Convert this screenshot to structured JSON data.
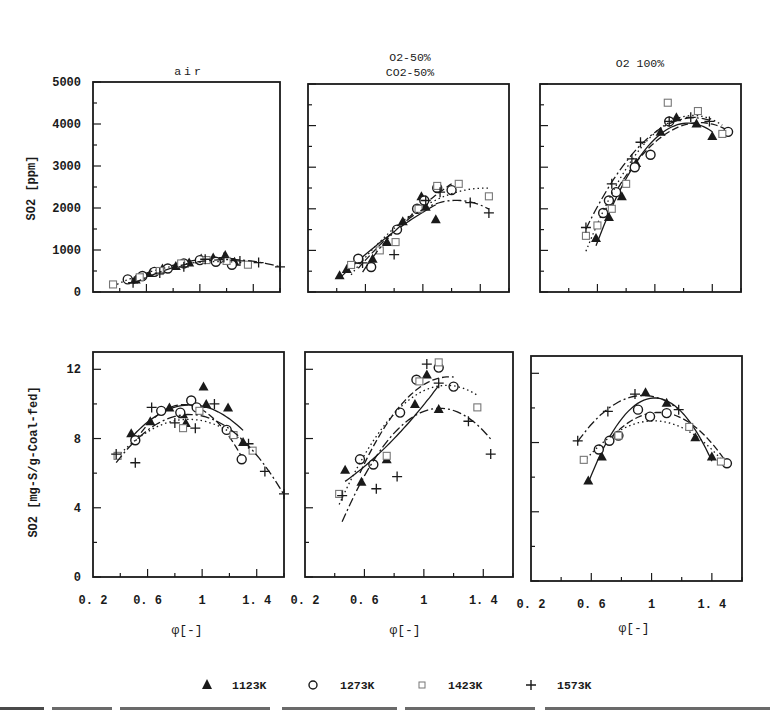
{
  "figure": {
    "caption_partial": "SO2 emission ... different O2 concentration ... N2 and CO2 ..."
  },
  "chart_data": [
    {
      "type": "scatter",
      "panel": "top-left",
      "title": "air",
      "xlabel": "",
      "ylabel": "SO2 [ppm]",
      "xlim": [
        0.2,
        1.6
      ],
      "ylim": [
        0,
        5000
      ],
      "yticks": [
        0,
        1000,
        2000,
        3000,
        4000,
        5000
      ],
      "xticks": [
        0.6,
        1.0,
        1.4
      ],
      "legend": [
        "1123K",
        "1273K",
        "1423K",
        "1573K"
      ],
      "series": [
        {
          "name": "1123K",
          "marker": "filled-triangle",
          "x": [
            0.52,
            0.63,
            0.72,
            0.82,
            0.92,
            1.01,
            1.1,
            1.19,
            1.26
          ],
          "y": [
            300,
            450,
            560,
            620,
            700,
            800,
            820,
            880,
            720
          ]
        },
        {
          "name": "1273K",
          "marker": "open-circle",
          "x": [
            0.46,
            0.57,
            0.66,
            0.76,
            0.88,
            1.0,
            1.12,
            1.24
          ],
          "y": [
            300,
            380,
            480,
            560,
            680,
            760,
            720,
            650
          ]
        },
        {
          "name": "1423K",
          "marker": "open-square",
          "x": [
            0.35,
            0.55,
            0.7,
            0.86,
            1.05,
            1.2,
            1.36
          ],
          "y": [
            180,
            350,
            500,
            680,
            760,
            740,
            650
          ]
        },
        {
          "name": "1573K",
          "marker": "plus",
          "x": [
            0.5,
            0.7,
            0.88,
            1.04,
            1.18,
            1.3,
            1.44,
            1.6
          ],
          "y": [
            220,
            450,
            600,
            780,
            820,
            740,
            700,
            600
          ]
        }
      ]
    },
    {
      "type": "scatter",
      "panel": "top-middle",
      "title": "O2-50%\nCO2-50%",
      "title_lines": [
        "O2-50%",
        "CO2-50%"
      ],
      "xlabel": "",
      "ylabel": "",
      "xlim": [
        0.2,
        1.6
      ],
      "ylim": [
        0,
        5000
      ],
      "xticks": [
        0.6,
        1.0,
        1.4
      ],
      "series": [
        {
          "name": "1123K",
          "marker": "filled-triangle",
          "x": [
            0.42,
            0.47,
            0.65,
            0.75,
            0.86,
            0.99,
            1.02,
            1.09
          ],
          "y": [
            400,
            550,
            800,
            1200,
            1700,
            2300,
            2050,
            1750
          ]
        },
        {
          "name": "1273K",
          "marker": "open-circle",
          "x": [
            0.55,
            0.64,
            0.82,
            0.96,
            1.01,
            1.1,
            1.2
          ],
          "y": [
            800,
            600,
            1500,
            2000,
            2200,
            2500,
            2450
          ]
        },
        {
          "name": "1423K",
          "marker": "open-square",
          "x": [
            0.5,
            0.7,
            0.81,
            0.97,
            1.1,
            1.25,
            1.46
          ],
          "y": [
            650,
            1000,
            1200,
            2000,
            2550,
            2600,
            2300
          ]
        },
        {
          "name": "1573K",
          "marker": "plus",
          "x": [
            0.58,
            0.8,
            1.02,
            1.12,
            1.33,
            1.46
          ],
          "y": [
            700,
            900,
            2200,
            2400,
            2150,
            1900
          ]
        }
      ]
    },
    {
      "type": "scatter",
      "panel": "top-right",
      "title": "O2 100%",
      "xlabel": "",
      "ylabel": "",
      "xlim": [
        0.2,
        1.6
      ],
      "ylim": [
        0,
        5000
      ],
      "xticks": [
        0.6,
        1.0,
        1.4
      ],
      "series": [
        {
          "name": "1123K",
          "marker": "filled-triangle",
          "x": [
            0.59,
            0.68,
            0.77,
            0.87,
            1.04,
            1.15,
            1.29,
            1.4
          ],
          "y": [
            1300,
            1800,
            2300,
            3100,
            3850,
            4200,
            4050,
            3750
          ]
        },
        {
          "name": "1273K",
          "marker": "open-circle",
          "x": [
            0.64,
            0.68,
            0.73,
            0.86,
            0.97,
            1.1,
            1.51
          ],
          "y": [
            1900,
            2200,
            2400,
            3000,
            3300,
            4100,
            3850
          ]
        },
        {
          "name": "1423K",
          "marker": "open-square",
          "x": [
            0.52,
            0.6,
            0.7,
            0.8,
            1.09,
            1.3,
            1.47
          ],
          "y": [
            1350,
            1600,
            2000,
            2600,
            4550,
            4350,
            3800
          ]
        },
        {
          "name": "1573K",
          "marker": "plus",
          "x": [
            0.52,
            0.7,
            0.84,
            0.9,
            1.1,
            1.25,
            1.38
          ],
          "y": [
            1550,
            2600,
            3200,
            3600,
            4100,
            4200,
            4100
          ]
        }
      ]
    },
    {
      "type": "scatter",
      "panel": "bottom-left",
      "title": "",
      "xlabel": "φ[-]",
      "ylabel": "SO2 [mg-S/g-Coal-fed]",
      "xlim": [
        0.2,
        1.6
      ],
      "ylim": [
        0,
        13
      ],
      "yticks": [
        0,
        4,
        8,
        12
      ],
      "xticks": [
        0.2,
        0.6,
        1.0,
        1.4
      ],
      "series": [
        {
          "name": "1123K",
          "marker": "filled-triangle",
          "x": [
            0.48,
            0.62,
            0.76,
            0.86,
            0.88,
            1.01,
            1.03,
            1.19,
            1.3
          ],
          "y": [
            8.3,
            9.0,
            9.8,
            9.4,
            8.9,
            11.0,
            10.0,
            9.8,
            7.8
          ]
        },
        {
          "name": "1273K",
          "marker": "open-circle",
          "x": [
            0.51,
            0.7,
            0.84,
            0.92,
            0.96,
            1.18,
            1.29
          ],
          "y": [
            7.9,
            9.6,
            9.5,
            10.2,
            9.8,
            8.5,
            6.8
          ]
        },
        {
          "name": "1423K",
          "marker": "open-square",
          "x": [
            0.38,
            0.86,
            0.98,
            1.23,
            1.37
          ],
          "y": [
            7.0,
            8.6,
            9.6,
            8.2,
            7.3
          ]
        },
        {
          "name": "1573K",
          "marker": "plus",
          "x": [
            0.37,
            0.51,
            0.63,
            0.8,
            0.95,
            1.09,
            1.34,
            1.46,
            1.6
          ],
          "y": [
            7.1,
            6.6,
            9.8,
            8.9,
            8.6,
            10.0,
            7.7,
            6.1,
            4.8
          ]
        }
      ]
    },
    {
      "type": "scatter",
      "panel": "bottom-middle",
      "title": "",
      "xlabel": "φ[-]",
      "ylabel": "",
      "xlim": [
        0.2,
        1.6
      ],
      "ylim": [
        0,
        13
      ],
      "xticks": [
        0.2,
        0.6,
        1.0,
        1.4
      ],
      "series": [
        {
          "name": "1123K",
          "marker": "filled-triangle",
          "x": [
            0.47,
            0.58,
            0.75,
            0.94,
            1.02,
            1.1
          ],
          "y": [
            6.2,
            5.5,
            6.8,
            10.0,
            11.7,
            9.7
          ]
        },
        {
          "name": "1273K",
          "marker": "open-circle",
          "x": [
            0.57,
            0.66,
            0.84,
            0.95,
            1.1,
            1.2
          ],
          "y": [
            6.8,
            6.5,
            9.5,
            11.4,
            12.1,
            11.0
          ]
        },
        {
          "name": "1423K",
          "marker": "open-square",
          "x": [
            0.43,
            0.75,
            0.97,
            1.1,
            1.36
          ],
          "y": [
            4.8,
            7.0,
            11.3,
            12.4,
            9.8
          ]
        },
        {
          "name": "1573K",
          "marker": "plus",
          "x": [
            0.45,
            0.68,
            0.82,
            1.02,
            1.1,
            1.3,
            1.45
          ],
          "y": [
            4.7,
            5.1,
            5.8,
            12.3,
            11.2,
            9.0,
            7.1
          ]
        }
      ]
    },
    {
      "type": "scatter",
      "panel": "bottom-right",
      "title": "",
      "xlabel": "φ[-]",
      "ylabel": "",
      "xlim": [
        0.2,
        1.6
      ],
      "ylim": [
        0,
        13
      ],
      "xticks": [
        0.2,
        0.6,
        1.0,
        1.4
      ],
      "series": [
        {
          "name": "1123K",
          "marker": "filled-triangle",
          "x": [
            0.58,
            0.67,
            0.96,
            1.1,
            1.29,
            1.4
          ],
          "y": [
            5.8,
            7.2,
            10.9,
            10.3,
            8.3,
            7.2
          ]
        },
        {
          "name": "1273K",
          "marker": "open-circle",
          "x": [
            0.65,
            0.72,
            0.78,
            0.91,
            0.99,
            1.1,
            1.5
          ],
          "y": [
            7.6,
            8.1,
            8.4,
            9.9,
            9.5,
            9.7,
            6.8
          ]
        },
        {
          "name": "1423K",
          "marker": "open-square",
          "x": [
            0.55,
            0.78,
            1.25,
            1.46
          ],
          "y": [
            7.0,
            8.4,
            8.9,
            6.9
          ]
        },
        {
          "name": "1573K",
          "marker": "plus",
          "x": [
            0.51,
            0.71,
            0.89,
            1.18
          ],
          "y": [
            8.1,
            9.8,
            10.8,
            9.9
          ]
        }
      ]
    }
  ],
  "legend": {
    "items": [
      {
        "symbol": "filled-triangle",
        "label": "1123K"
      },
      {
        "symbol": "open-circle",
        "label": "1273K"
      },
      {
        "symbol": "open-square",
        "label": "1423K"
      },
      {
        "symbol": "plus",
        "label": "1573K"
      }
    ]
  },
  "colors": {
    "ink": "#1a1a1a",
    "background": "#ffffff",
    "square_marker": "#777777"
  }
}
